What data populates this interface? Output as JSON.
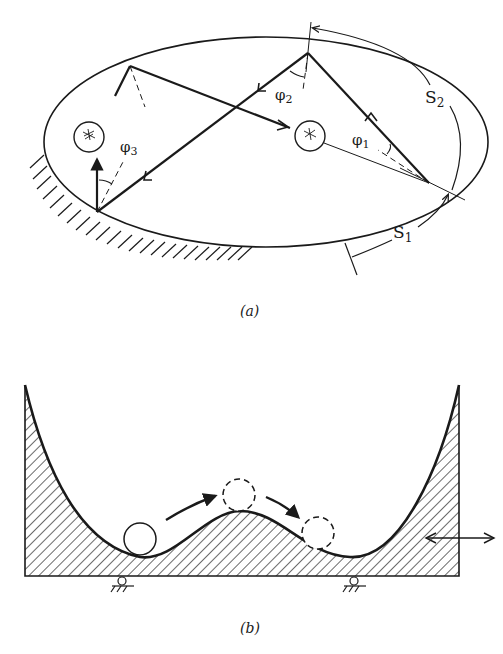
{
  "figure": {
    "panel_a": {
      "caption": "(a)",
      "description": "Elliptical billiard with two circular scatterers; trajectory of a bouncing particle with reflection angles",
      "labels": {
        "s1": "S",
        "s1_sub": "1",
        "s2": "S",
        "s2_sub": "2",
        "phi1": "φ",
        "phi1_sub": "1",
        "phi2": "φ",
        "phi2_sub": "2",
        "phi3": "φ",
        "phi3_sub": "3"
      }
    },
    "panel_b": {
      "caption": "(b)",
      "description": "Ball in a double-well potential on a box mounted on rollers, driven horizontally"
    },
    "colors": {
      "ink": "#1a1a1a",
      "background": "#ffffff"
    }
  }
}
